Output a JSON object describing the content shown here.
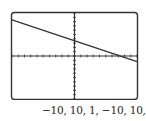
{
  "chart_data": {
    "type": "line",
    "title": "",
    "xlabel": "",
    "ylabel": "",
    "window": {
      "xmin": -10,
      "xmax": 10,
      "xscl": 1,
      "ymin": -10,
      "ymax": 10,
      "yscl": 1
    },
    "xlim": [
      -10,
      10
    ],
    "ylim": [
      -10,
      10
    ],
    "grid": false,
    "series": [
      {
        "name": "line",
        "x": [
          -10,
          10
        ],
        "y": [
          8.4,
          -1.3
        ]
      }
    ],
    "annotations": [
      "-10, 10, 1, -10, 10, 1"
    ]
  },
  "window_label": "−10, 10, 1, −10, 10, 1",
  "colors": {
    "frame": "#333333",
    "line": "#333333",
    "axes": "#333333"
  }
}
